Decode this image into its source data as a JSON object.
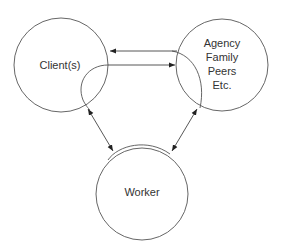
{
  "diagram": {
    "nodes": [
      {
        "id": "client",
        "label": "Client(s)"
      },
      {
        "id": "agency",
        "lines": [
          "Agency",
          "Family",
          "Peers",
          "Etc."
        ]
      },
      {
        "id": "worker",
        "label": "Worker"
      }
    ],
    "edges": [
      {
        "from": "agency",
        "to": "client",
        "type": "arrow"
      },
      {
        "from": "client",
        "to": "agency",
        "type": "arrow"
      },
      {
        "from": "client",
        "to": "worker",
        "type": "double-arrow"
      },
      {
        "from": "agency",
        "to": "worker",
        "type": "double-arrow"
      }
    ],
    "colors": {
      "stroke": "#555555",
      "text": "#333333",
      "background": "#ffffff"
    }
  }
}
